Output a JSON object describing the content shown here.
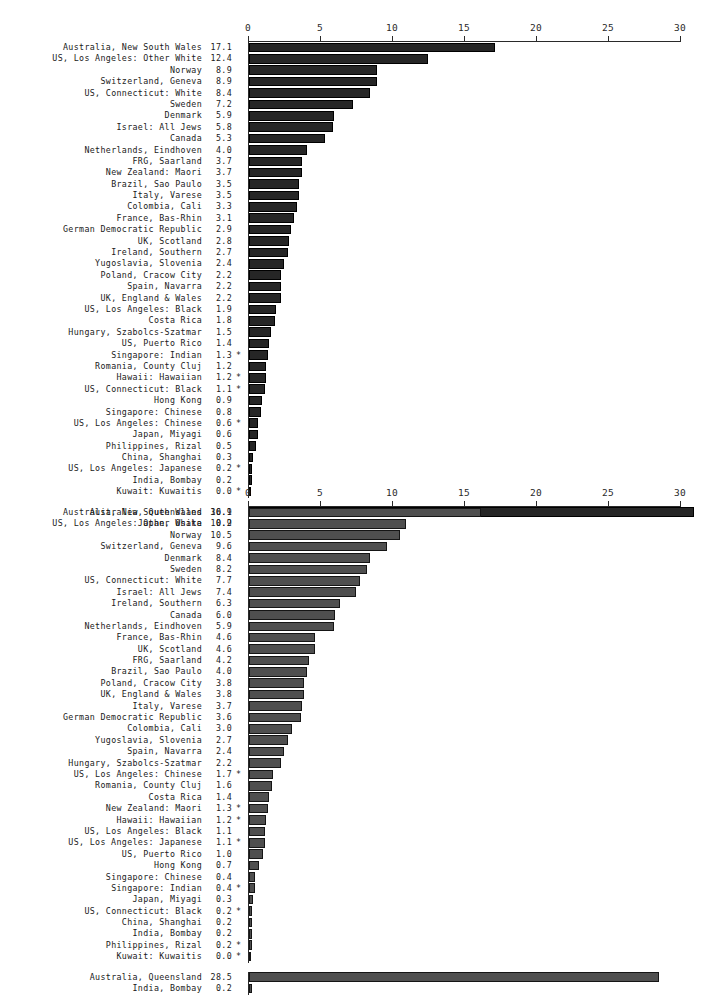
{
  "figure": {
    "background": "#ffffff",
    "label_color": "#1a1a1a",
    "axis_color": "#2a2a2a"
  },
  "chart_data": [
    {
      "id": "top",
      "type": "bar",
      "orientation": "horizontal",
      "title": "",
      "xlabel": "",
      "ylabel": "",
      "xlim": [
        0,
        30
      ],
      "xticks": [
        0,
        5,
        10,
        15,
        20,
        25,
        30
      ],
      "xtick_labels": [
        "0",
        "5",
        "10",
        "15",
        "20",
        "25",
        "30"
      ],
      "grid": false,
      "legend": "none",
      "bar_color": "#262626",
      "footnote_marker": "*",
      "categories": [
        "Australia, New South Wales",
        "US, Los Angeles: Other White",
        "Norway",
        "Switzerland, Geneva",
        "US, Connecticut: White",
        "Sweden",
        "Denmark",
        "Israel: All Jews",
        "Canada",
        "Netherlands, Eindhoven",
        "FRG, Saarland",
        "New Zealand: Maori",
        "Brazil, Sao Paulo",
        "Italy, Varese",
        "Colombia, Cali",
        "France, Bas-Rhin",
        "German Democratic Republic",
        "UK, Scotland",
        "Ireland, Southern",
        "Yugoslavia, Slovenia",
        "Poland, Cracow City",
        "Spain, Navarra",
        "UK, England & Wales",
        "US, Los Angeles: Black",
        "Costa Rica",
        "Hungary, Szabolcs-Szatmar",
        "US, Puerto Rico",
        "Singapore: Indian",
        "Romania, County Cluj",
        "Hawaii: Hawaiian",
        "US, Connecticut: Black",
        "Hong Kong",
        "Singapore: Chinese",
        "US, Los Angeles: Chinese",
        "Japan, Miyagi",
        "Philippines, Rizal",
        "China, Shanghai",
        "US, Los Angeles: Japanese",
        "India, Bombay",
        "Kuwait: Kuwaitis"
      ],
      "values": [
        17.1,
        12.4,
        8.9,
        8.9,
        8.4,
        7.2,
        5.9,
        5.8,
        5.3,
        4.0,
        3.7,
        3.7,
        3.5,
        3.5,
        3.3,
        3.1,
        2.9,
        2.8,
        2.7,
        2.4,
        2.2,
        2.2,
        2.2,
        1.9,
        1.8,
        1.5,
        1.4,
        1.3,
        1.2,
        1.2,
        1.1,
        0.9,
        0.8,
        0.6,
        0.6,
        0.5,
        0.3,
        0.2,
        0.2,
        0.0
      ],
      "value_labels": [
        "17.1",
        "12.4",
        "8.9",
        "8.9",
        "8.4",
        "7.2",
        "5.9",
        "5.8",
        "5.3",
        "4.0",
        "3.7",
        "3.7",
        "3.5",
        "3.5",
        "3.3",
        "3.1",
        "2.9",
        "2.8",
        "2.7",
        "2.4",
        "2.2",
        "2.2",
        "2.2",
        "1.9",
        "1.8",
        "1.5",
        "1.4",
        "1.3",
        "1.2",
        "1.2",
        "1.1",
        "0.9",
        "0.8",
        "0.6",
        "0.6",
        "0.5",
        "0.3",
        "0.2",
        "0.2",
        "0.0"
      ],
      "stars": [
        "",
        "",
        "",
        "",
        "",
        "",
        "",
        "",
        "",
        "",
        "",
        "",
        "",
        "",
        "",
        "",
        "",
        "",
        "",
        "",
        "",
        "",
        "",
        "",
        "",
        "",
        "",
        "*",
        "",
        "*",
        "*",
        "",
        "",
        "*",
        "",
        "",
        "",
        "*",
        "",
        "*"
      ],
      "extra_group": {
        "categories": [
          "Australia, Queensland",
          "Japan, Osaka"
        ],
        "values": [
          30.9,
          0.2
        ],
        "value_labels": [
          "30.9",
          "0.2"
        ],
        "stars": [
          "",
          ""
        ]
      }
    },
    {
      "id": "bottom",
      "type": "bar",
      "orientation": "horizontal",
      "title": "",
      "xlabel": "",
      "ylabel": "",
      "xlim": [
        0,
        30
      ],
      "xticks": [
        0,
        5,
        10,
        15,
        20,
        25,
        30
      ],
      "xtick_labels": [
        "0",
        "5",
        "10",
        "15",
        "20",
        "25",
        "30"
      ],
      "grid": false,
      "legend": "none",
      "bar_color": "#4f4f4f",
      "footnote_marker": "*",
      "categories": [
        "Australia, New South Wales",
        "US, Los Angeles: Other White",
        "Norway",
        "Switzerland, Geneva",
        "Denmark",
        "Sweden",
        "US, Connecticut: White",
        "Israel: All Jews",
        "Ireland, Southern",
        "Canada",
        "Netherlands, Eindhoven",
        "France, Bas-Rhin",
        "UK, Scotland",
        "FRG, Saarland",
        "Brazil, Sao Paulo",
        "Poland, Cracow City",
        "UK, England & Wales",
        "Italy, Varese",
        "German Democratic Republic",
        "Colombia, Cali",
        "Yugoslavia, Slovenia",
        "Spain, Navarra",
        "Hungary, Szabolcs-Szatmar",
        "US, Los Angeles: Chinese",
        "Romania, County Cluj",
        "Costa Rica",
        "New Zealand: Maori",
        "Hawaii: Hawaiian",
        "US, Los Angeles: Black",
        "US, Los Angeles: Japanese",
        "US, Puerto Rico",
        "Hong Kong",
        "Singapore: Chinese",
        "Singapore: Indian",
        "Japan, Miyagi",
        "US, Connecticut: Black",
        "China, Shanghai",
        "India, Bombay",
        "Philippines, Rizal",
        "Kuwait: Kuwaitis"
      ],
      "values": [
        16.1,
        10.9,
        10.5,
        9.6,
        8.4,
        8.2,
        7.7,
        7.4,
        6.3,
        6.0,
        5.9,
        4.6,
        4.6,
        4.2,
        4.0,
        3.8,
        3.8,
        3.7,
        3.6,
        3.0,
        2.7,
        2.4,
        2.2,
        1.7,
        1.6,
        1.4,
        1.3,
        1.2,
        1.1,
        1.1,
        1.0,
        0.7,
        0.4,
        0.4,
        0.3,
        0.2,
        0.2,
        0.2,
        0.2,
        0.0
      ],
      "value_labels": [
        "16.1",
        "10.9",
        "10.5",
        "9.6",
        "8.4",
        "8.2",
        "7.7",
        "7.4",
        "6.3",
        "6.0",
        "5.9",
        "4.6",
        "4.6",
        "4.2",
        "4.0",
        "3.8",
        "3.8",
        "3.7",
        "3.6",
        "3.0",
        "2.7",
        "2.4",
        "2.2",
        "1.7",
        "1.6",
        "1.4",
        "1.3",
        "1.2",
        "1.1",
        "1.1",
        "1.0",
        "0.7",
        "0.4",
        "0.4",
        "0.3",
        "0.2",
        "0.2",
        "0.2",
        "0.2",
        "0.0"
      ],
      "stars": [
        "",
        "",
        "",
        "",
        "",
        "",
        "",
        "",
        "",
        "",
        "",
        "",
        "",
        "",
        "",
        "",
        "",
        "",
        "",
        "",
        "",
        "",
        "",
        "*",
        "",
        "",
        "*",
        "*",
        "",
        "*",
        "",
        "",
        "",
        "*",
        "",
        "*",
        "",
        "",
        "*",
        "*"
      ],
      "extra_group": {
        "categories": [
          "Australia, Queensland",
          "India, Bombay"
        ],
        "values": [
          28.5,
          0.2
        ],
        "value_labels": [
          "28.5",
          "0.2"
        ],
        "stars": [
          "",
          ""
        ]
      }
    }
  ]
}
